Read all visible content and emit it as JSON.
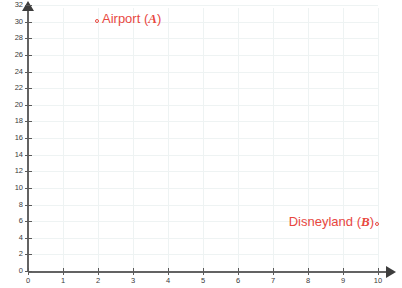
{
  "chart_data": {
    "type": "scatter",
    "title": "",
    "xlabel": "",
    "ylabel": "",
    "xlim": [
      0,
      10
    ],
    "ylim": [
      0,
      33
    ],
    "grid": true,
    "legend": "none",
    "x_ticks": [
      "0",
      "1",
      "2",
      "3",
      "4",
      "5",
      "6",
      "7",
      "8",
      "9",
      "10"
    ],
    "y_ticks": [
      "0",
      "2",
      "4",
      "6",
      "8",
      "10",
      "12",
      "14",
      "16",
      "18",
      "20",
      "22",
      "24",
      "26",
      "28",
      "30",
      "32"
    ],
    "points": [
      {
        "name": "airport",
        "label_text": "Airport (",
        "symbol": "A",
        "label_close": ")",
        "marker_side": "left",
        "x": 2.0,
        "y": 30.0,
        "color": "#e8483f"
      },
      {
        "name": "disneyland",
        "label_text": "Disneyland (",
        "symbol": "B",
        "label_close": ")",
        "marker_side": "right",
        "x": 10.0,
        "y": 5.5,
        "color": "#e8483f"
      }
    ]
  },
  "style": {
    "accent": "#e8483f",
    "axis_color": "#636363",
    "grid_color": "#eef3f3",
    "background": "#ffffff"
  }
}
